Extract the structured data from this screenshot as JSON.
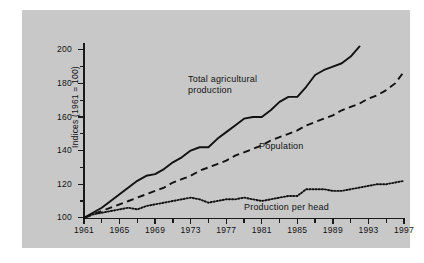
{
  "chart_data": {
    "type": "line",
    "title": "",
    "xlabel": "",
    "ylabel": "Indices (1961 = 100)",
    "xlim": [
      1961,
      1997
    ],
    "ylim": [
      96,
      208
    ],
    "grid": false,
    "legend_position": "inline-annotations",
    "x_ticks": [
      1961,
      1965,
      1969,
      1973,
      1977,
      1981,
      1985,
      1989,
      1993,
      1997
    ],
    "x_minor_ticks": [
      1963,
      1967,
      1971,
      1975,
      1979,
      1983,
      1987,
      1991,
      1995
    ],
    "y_ticks": [
      100,
      120,
      140,
      160,
      180,
      200
    ],
    "y_minor_ticks": [
      110,
      130,
      150,
      170,
      190
    ],
    "x": [
      1961,
      1962,
      1963,
      1964,
      1965,
      1966,
      1967,
      1968,
      1969,
      1970,
      1971,
      1972,
      1973,
      1974,
      1975,
      1976,
      1977,
      1978,
      1979,
      1980,
      1981,
      1982,
      1983,
      1984,
      1985,
      1986,
      1987,
      1988,
      1989,
      1990,
      1991,
      1992,
      1993,
      1994,
      1995,
      1996,
      1997
    ],
    "series": [
      {
        "name": "Total agricultural production",
        "style": "solid",
        "color": "#111111",
        "values": [
          100,
          103,
          106,
          110,
          114,
          118,
          122,
          125,
          126,
          129,
          133,
          136,
          140,
          142,
          142,
          147,
          151,
          155,
          159,
          160,
          160,
          164,
          169,
          172,
          172,
          178,
          185,
          188,
          190,
          192,
          196,
          202,
          null,
          null,
          null,
          null,
          null
        ]
      },
      {
        "name": "Population",
        "style": "dashed",
        "color": "#111111",
        "values": [
          100,
          102,
          104,
          106,
          108,
          110,
          112,
          114,
          116,
          118,
          121,
          123,
          125,
          128,
          130,
          132,
          134,
          137,
          139,
          141,
          143,
          146,
          148,
          150,
          152,
          155,
          157,
          159,
          161,
          164,
          166,
          168,
          171,
          173,
          176,
          180,
          187
        ]
      },
      {
        "name": "Production per head",
        "style": "dotted",
        "color": "#111111",
        "values": [
          100,
          102,
          103,
          104,
          105,
          106,
          105,
          107,
          108,
          109,
          110,
          111,
          112,
          111,
          109,
          110,
          111,
          111,
          112,
          111,
          110,
          111,
          112,
          113,
          113,
          117,
          117,
          117,
          116,
          116,
          117,
          118,
          119,
          120,
          120,
          121,
          122
        ]
      }
    ],
    "annotations": [
      {
        "id": "total",
        "text_line1": "Total agricultural",
        "text_line2": "production"
      },
      {
        "id": "population",
        "text": "Population"
      },
      {
        "id": "per_head",
        "text": "Production per head"
      }
    ],
    "colors": {
      "panel": "#c8c8c8",
      "ink": "#111111",
      "page": "#ffffff"
    }
  }
}
